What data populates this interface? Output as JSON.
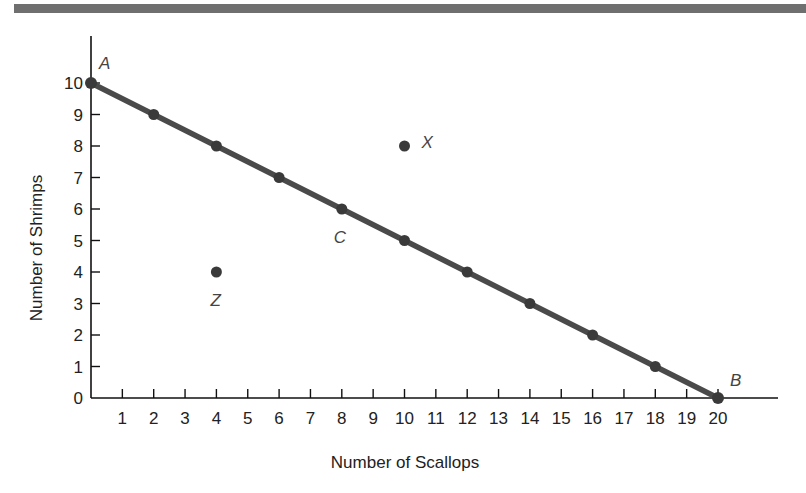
{
  "chart_data": {
    "type": "line",
    "title": "",
    "xlabel": "Number of Scallops",
    "ylabel": "Number of Shrimps",
    "xlim": [
      0,
      20
    ],
    "ylim": [
      0,
      10
    ],
    "grid": false,
    "x_ticks": [
      1,
      2,
      3,
      4,
      5,
      6,
      7,
      8,
      9,
      10,
      11,
      12,
      13,
      14,
      15,
      16,
      17,
      18,
      19,
      20
    ],
    "y_ticks": [
      0,
      1,
      2,
      3,
      4,
      5,
      6,
      7,
      8,
      9,
      10
    ],
    "series": [
      {
        "name": "Production possibilities frontier",
        "x": [
          0,
          2,
          4,
          6,
          8,
          10,
          12,
          14,
          16,
          18,
          20
        ],
        "y": [
          10,
          9,
          8,
          7,
          6,
          5,
          4,
          3,
          2,
          1,
          0
        ]
      }
    ],
    "points": [
      {
        "label": "A",
        "x": 0,
        "y": 10
      },
      {
        "label": "B",
        "x": 20,
        "y": 0
      },
      {
        "label": "C",
        "x": 8,
        "y": 6
      },
      {
        "label": "X",
        "x": 10,
        "y": 8
      },
      {
        "label": "Z",
        "x": 4,
        "y": 4
      }
    ]
  },
  "labels": {
    "xlabel": "Number of Scallops",
    "ylabel": "Number of Shrimps",
    "A": "A",
    "B": "B",
    "C": "C",
    "X": "X",
    "Z": "Z"
  }
}
